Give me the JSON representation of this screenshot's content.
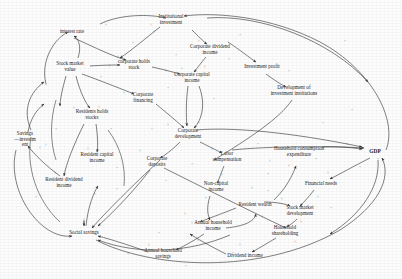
{
  "diagram": {
    "type": "causal-loop-diagram",
    "stroke_color": "#3a3a3a",
    "text_color": "#1a1a1a",
    "background_color": "#fdfdfd",
    "nodes": [
      {
        "id": "interest_rate",
        "label": "interest rate",
        "x": 72,
        "y": 32
      },
      {
        "id": "institutional_invest",
        "label": "Institutional\ninvestment",
        "x": 171,
        "y": 20
      },
      {
        "id": "stock_market_value",
        "label": "Stock market\nvalue",
        "x": 70,
        "y": 67
      },
      {
        "id": "corporate_holds_stock",
        "label": "corporate holds\nstock",
        "x": 134,
        "y": 65
      },
      {
        "id": "corporate_dividend",
        "label": "Corporate dividend\nincome",
        "x": 210,
        "y": 50
      },
      {
        "id": "corporate_capital",
        "label": "Corporate capital\nincome",
        "x": 192,
        "y": 78
      },
      {
        "id": "investment_profit",
        "label": "Investment profit",
        "x": 262,
        "y": 67
      },
      {
        "id": "dev_invest_inst",
        "label": "Development of\ninvestment institutions",
        "x": 294,
        "y": 91
      },
      {
        "id": "corporate_financing",
        "label": "Corporate\nfinancing",
        "x": 143,
        "y": 98
      },
      {
        "id": "residents_hold_stocks",
        "label": "Residents holds\nstocks",
        "x": 92,
        "y": 115
      },
      {
        "id": "savings_investment",
        "label": "Savings\n—investm\nent",
        "x": 25,
        "y": 140
      },
      {
        "id": "resident_capital_inc",
        "label": "Resident capital\nincome",
        "x": 97,
        "y": 158
      },
      {
        "id": "resident_div_income",
        "label": "Resident dividend\nincome",
        "x": 64,
        "y": 183
      },
      {
        "id": "corporate_development",
        "label": "Corporate\ndevelopment",
        "x": 188,
        "y": 134
      },
      {
        "id": "corporate_deposits",
        "label": "Corporate\ndeposits",
        "x": 157,
        "y": 162
      },
      {
        "id": "labor_compensation",
        "label": "Labor\ncompensation",
        "x": 227,
        "y": 157
      },
      {
        "id": "non_capital_income",
        "label": "Non-capital\nincome",
        "x": 216,
        "y": 187
      },
      {
        "id": "household_consumption",
        "label": "Household consumption\nexpenditure",
        "x": 299,
        "y": 152
      },
      {
        "id": "gdp",
        "label": "GDP",
        "x": 375,
        "y": 151
      },
      {
        "id": "financial_needs",
        "label": "Financial needs",
        "x": 321,
        "y": 184
      },
      {
        "id": "resident_wealth",
        "label": "Resident wealth",
        "x": 255,
        "y": 205
      },
      {
        "id": "stock_market_dev",
        "label": "Stock market\ndevelopment",
        "x": 300,
        "y": 211
      },
      {
        "id": "household_shareholding",
        "label": "Household\nshareholding",
        "x": 285,
        "y": 231
      },
      {
        "id": "annual_hh_income",
        "label": "Annual household\nincome",
        "x": 213,
        "y": 226
      },
      {
        "id": "dividend_income",
        "label": "Dividend income",
        "x": 245,
        "y": 256
      },
      {
        "id": "social_savings",
        "label": "Social savings",
        "x": 84,
        "y": 233
      },
      {
        "id": "annual_hh_savings",
        "label": "Annual household\nsavings",
        "x": 163,
        "y": 254
      }
    ],
    "polarity_signs": [
      {
        "sign": "+",
        "x": 154,
        "y": 31
      },
      {
        "sign": "+",
        "x": 151,
        "y": 24
      },
      {
        "sign": "+",
        "x": 118,
        "y": 56
      },
      {
        "sign": "+",
        "x": 110,
        "y": 65
      },
      {
        "sign": "+",
        "x": 166,
        "y": 70
      },
      {
        "sign": "+",
        "x": 199,
        "y": 40
      },
      {
        "sign": "+",
        "x": 205,
        "y": 66
      },
      {
        "sign": "+",
        "x": 182,
        "y": 68
      },
      {
        "sign": "+",
        "x": 124,
        "y": 92
      },
      {
        "sign": "+",
        "x": 74,
        "y": 107
      },
      {
        "sign": "+",
        "x": 99,
        "y": 106
      },
      {
        "sign": "+",
        "x": 88,
        "y": 148
      },
      {
        "sign": "+",
        "x": 55,
        "y": 172
      },
      {
        "sign": "+",
        "x": 40,
        "y": 147
      },
      {
        "sign": "+",
        "x": 46,
        "y": 144
      },
      {
        "sign": "+",
        "x": 168,
        "y": 124
      },
      {
        "sign": "+",
        "x": 199,
        "y": 122
      },
      {
        "sign": "+",
        "x": 152,
        "y": 128
      },
      {
        "sign": "+",
        "x": 140,
        "y": 150
      },
      {
        "sign": "+",
        "x": 212,
        "y": 148
      },
      {
        "sign": "+",
        "x": 222,
        "y": 174
      },
      {
        "sign": "+",
        "x": 206,
        "y": 197
      },
      {
        "sign": "+",
        "x": 270,
        "y": 160
      },
      {
        "sign": "+",
        "x": 289,
        "y": 165
      },
      {
        "sign": "+",
        "x": 347,
        "y": 143
      },
      {
        "sign": "+",
        "x": 328,
        "y": 172
      },
      {
        "sign": "+",
        "x": 282,
        "y": 198
      },
      {
        "sign": "+",
        "x": 301,
        "y": 221
      },
      {
        "sign": "+",
        "x": 295,
        "y": 241
      },
      {
        "sign": "+",
        "x": 240,
        "y": 244
      },
      {
        "sign": "+",
        "x": 192,
        "y": 222
      },
      {
        "sign": "+",
        "x": 198,
        "y": 240
      },
      {
        "sign": "+",
        "x": 84,
        "y": 219
      },
      {
        "sign": "+",
        "x": 262,
        "y": 216
      },
      {
        "sign": "+",
        "x": 252,
        "y": 187
      },
      {
        "sign": "+",
        "x": 185,
        "y": 213
      },
      {
        "sign": "+",
        "x": 318,
        "y": 196
      },
      {
        "sign": "+",
        "x": 149,
        "y": 244
      }
    ],
    "loop_markers": [
      {
        "x": 106,
        "y": 24
      },
      {
        "x": 133,
        "y": 42
      },
      {
        "x": 229,
        "y": 58
      },
      {
        "x": 176,
        "y": 54
      },
      {
        "x": 168,
        "y": 87
      },
      {
        "x": 240,
        "y": 34
      },
      {
        "x": 345,
        "y": 40
      },
      {
        "x": 289,
        "y": 70
      },
      {
        "x": 323,
        "y": 122
      },
      {
        "x": 352,
        "y": 109
      },
      {
        "x": 101,
        "y": 76
      },
      {
        "x": 46,
        "y": 84
      },
      {
        "x": 36,
        "y": 196
      },
      {
        "x": 117,
        "y": 167
      },
      {
        "x": 192,
        "y": 163
      },
      {
        "x": 166,
        "y": 180
      },
      {
        "x": 117,
        "y": 188
      },
      {
        "x": 268,
        "y": 173
      },
      {
        "x": 316,
        "y": 158
      },
      {
        "x": 360,
        "y": 166
      },
      {
        "x": 331,
        "y": 207
      },
      {
        "x": 268,
        "y": 190
      },
      {
        "x": 233,
        "y": 252
      },
      {
        "x": 186,
        "y": 265
      },
      {
        "x": 128,
        "y": 253
      },
      {
        "x": 56,
        "y": 128
      },
      {
        "x": 111,
        "y": 128
      },
      {
        "x": 258,
        "y": 143
      },
      {
        "x": 159,
        "y": 232
      },
      {
        "x": 214,
        "y": 98
      },
      {
        "x": 378,
        "y": 158
      },
      {
        "x": 95,
        "y": 193
      }
    ]
  }
}
